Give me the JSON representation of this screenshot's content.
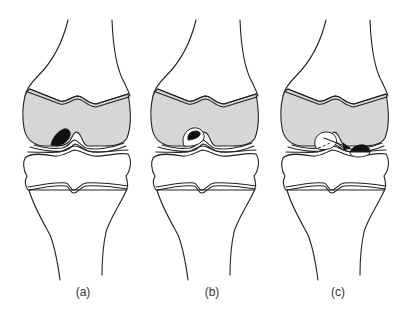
{
  "figure": {
    "panels": [
      {
        "id": "a",
        "label": "(a)",
        "stage": "in situ lesion (dark) in femoral condyle"
      },
      {
        "id": "b",
        "label": "(b)",
        "stage": "fragment partially separated within crater"
      },
      {
        "id": "c",
        "label": "(c)",
        "stage": "loose fragment displaced into joint (arrow)"
      }
    ],
    "colors": {
      "epiphysis_fill": "#d6d6d6",
      "lesion": "#111111",
      "line": "#222222"
    }
  }
}
